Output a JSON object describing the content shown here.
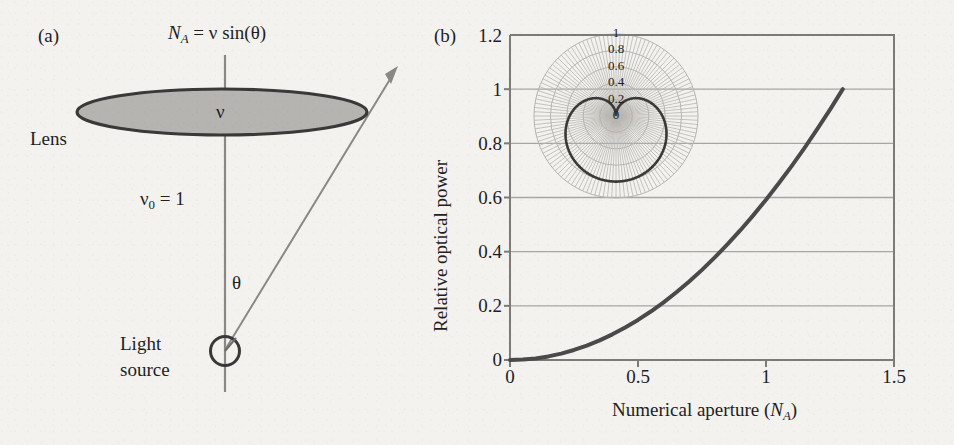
{
  "figure": {
    "background_color": "#f3f2ef",
    "ink_color": "#231f20"
  },
  "panel_a": {
    "label": "(a)",
    "equation": {
      "lhs_symbol": "N",
      "lhs_sub": "A",
      "rhs": "= ν sin(θ)"
    },
    "lens_label": "Lens",
    "lens_fill": "#b3b3b3",
    "aperture_symbol": "ν",
    "index_label": {
      "symbol": "ν",
      "sub": "0",
      "rest": "= 1"
    },
    "angle_label": "θ",
    "source_label_line1": "Light",
    "source_label_line2": "source"
  },
  "panel_b": {
    "label": "(b)"
  },
  "chart_data": {
    "type": "line",
    "title": "",
    "xlabel": "Numerical aperture (N_A)",
    "xlabel_main": "Numerical aperture (",
    "xlabel_sym": "N",
    "xlabel_sub": "A",
    "xlabel_close": ")",
    "ylabel": "Relative optical power",
    "xlim": [
      0,
      1.5
    ],
    "ylim": [
      0,
      1.2
    ],
    "xticks": [
      0,
      0.5,
      1,
      1.5
    ],
    "xticklabels": [
      "0",
      "0.5",
      "1",
      "1.5"
    ],
    "yticks": [
      0,
      0.2,
      0.4,
      0.6,
      0.8,
      1,
      1.2
    ],
    "yticklabels": [
      "0",
      "0.2",
      "0.4",
      "0.6",
      "0.8",
      "1",
      "1.2"
    ],
    "grid": "horizontal",
    "gridlines_y": [
      0.2,
      0.4,
      0.6,
      0.8,
      1.0
    ],
    "legend": "none",
    "series": [
      {
        "name": "Relative optical power vs numerical aperture",
        "color": "#4a4a4a",
        "linewidth": 4,
        "x": [
          0,
          0.05,
          0.1,
          0.15,
          0.2,
          0.25,
          0.3,
          0.35,
          0.4,
          0.45,
          0.5,
          0.55,
          0.6,
          0.65,
          0.7,
          0.75,
          0.8,
          0.85,
          0.9,
          0.95,
          1.0,
          1.05,
          1.1,
          1.15,
          1.2,
          1.25,
          1.3
        ],
        "y": [
          0.0,
          0.0015,
          0.0059,
          0.0133,
          0.0237,
          0.037,
          0.0533,
          0.0725,
          0.0947,
          0.1198,
          0.1479,
          0.179,
          0.213,
          0.25,
          0.2899,
          0.3328,
          0.3787,
          0.4275,
          0.4793,
          0.534,
          0.5917,
          0.6524,
          0.716,
          0.7825,
          0.8521,
          0.9246,
          1.0
        ]
      }
    ]
  },
  "inset": {
    "type": "polar",
    "description": "Lambertian emission pattern",
    "radial_ticks": [
      0,
      0.2,
      0.4,
      0.6,
      0.8,
      1
    ],
    "radial_ticklabels": [
      "0",
      "0.2",
      "0.4",
      "0.6",
      "0.8",
      "1"
    ],
    "grid_color": "#b8b5b0",
    "curve_color": "#3c3a38"
  }
}
